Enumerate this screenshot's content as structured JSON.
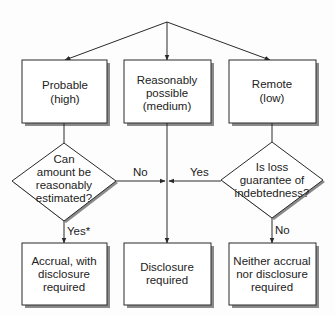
{
  "diagram": {
    "type": "flowchart",
    "colors": {
      "line": "#2a2a2a",
      "shadow": "#8a8a8a",
      "fill": "#ffffff",
      "text": "#222222"
    },
    "top_boxes": [
      {
        "id": "probable",
        "lines": [
          "Probable",
          "(high)"
        ]
      },
      {
        "id": "reasonably-possible",
        "lines": [
          "Reasonably",
          "possible",
          "(medium)"
        ]
      },
      {
        "id": "remote",
        "lines": [
          "Remote",
          "(low)"
        ]
      }
    ],
    "decisions": [
      {
        "id": "can-estimate",
        "lines": [
          "Can",
          "amount be",
          "reasonably",
          "estimated?"
        ]
      },
      {
        "id": "loss-guarantee",
        "lines": [
          "Is loss",
          "guarantee of",
          "indebtedness?"
        ]
      }
    ],
    "edge_labels": {
      "left_no": "No",
      "right_yes": "Yes",
      "left_yes": "Yes*",
      "right_no": "No"
    },
    "bottom_boxes": [
      {
        "id": "accrual",
        "lines": [
          "Accrual, with",
          "disclosure",
          "required"
        ]
      },
      {
        "id": "disclosure",
        "lines": [
          "Disclosure",
          "required"
        ]
      },
      {
        "id": "neither",
        "lines": [
          "Neither accrual",
          "nor disclosure",
          "required"
        ]
      }
    ]
  }
}
